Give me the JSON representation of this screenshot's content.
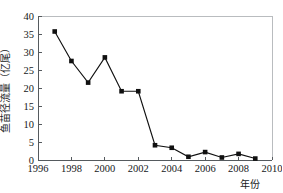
{
  "chart_data": {
    "type": "line",
    "title": "",
    "xlabel": "年份",
    "ylabel": "鱼苗径流量（亿尾）",
    "x": [
      1997,
      1998,
      1999,
      2000,
      2001,
      2002,
      2003,
      2004,
      2005,
      2006,
      2007,
      2008,
      2009
    ],
    "values": [
      35.7,
      27.5,
      21.5,
      28.5,
      19.1,
      19.1,
      4.1,
      3.4,
      0.9,
      2.2,
      0.7,
      1.7,
      0.4
    ],
    "series": [
      {
        "name": "鱼苗径流量",
        "values": [
          35.7,
          27.5,
          21.5,
          28.5,
          19.1,
          19.1,
          4.1,
          3.4,
          0.9,
          2.2,
          0.7,
          1.7,
          0.4
        ]
      }
    ],
    "xlim": [
      1996,
      2010
    ],
    "ylim": [
      0,
      40
    ],
    "xticks": [
      1996,
      1998,
      2000,
      2002,
      2004,
      2006,
      2008,
      2010
    ],
    "xtick_labels": [
      "1996",
      "1998",
      "2000",
      "2002",
      "2004",
      "2006",
      "2008",
      "2010"
    ],
    "yticks": [
      0,
      5,
      10,
      15,
      20,
      25,
      30,
      35,
      40
    ],
    "ytick_labels": [
      "0",
      "5",
      "10",
      "15",
      "20",
      "25",
      "30",
      "35",
      "40"
    ],
    "grid": false,
    "legend": false,
    "legend_position": "none",
    "marker": "square",
    "marker_color": "#101010",
    "line_color": "#101010"
  },
  "axes": {
    "y_label": "鱼苗径流量（亿尾）",
    "x_label": "年份"
  }
}
